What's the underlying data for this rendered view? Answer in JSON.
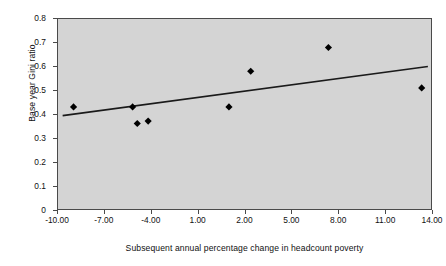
{
  "chart_data": {
    "type": "scatter",
    "title": "",
    "xlabel": "Subsequent annual percentage change in headcount poverty",
    "ylabel": "Base year Gini ratio",
    "xlim": [
      -10.0,
      14.0
    ],
    "ylim": [
      0,
      0.8
    ],
    "grid": false,
    "legend": null,
    "x_tick_labels": [
      "-10.00",
      "-7.00",
      "-4.00",
      "1.00",
      "2.00",
      "5.00",
      "8.00",
      "11.00",
      "14.00"
    ],
    "x_tick_values": [
      -10,
      -7,
      -4,
      -1,
      2,
      5,
      8,
      11,
      14
    ],
    "y_tick_labels": [
      "0",
      "0.1",
      "0.2",
      "0.3",
      "0.4",
      "0.5",
      "0.6",
      "0.7",
      "0.8"
    ],
    "y_tick_values": [
      0,
      0.1,
      0.2,
      0.3,
      0.4,
      0.5,
      0.6,
      0.7,
      0.8
    ],
    "series": [
      {
        "name": "observations",
        "marker": "diamond",
        "color": "#000000",
        "points": [
          {
            "x": -9.0,
            "y": 0.43
          },
          {
            "x": -5.2,
            "y": 0.43
          },
          {
            "x": -4.9,
            "y": 0.36
          },
          {
            "x": -4.2,
            "y": 0.37
          },
          {
            "x": 1.0,
            "y": 0.43
          },
          {
            "x": 2.4,
            "y": 0.58
          },
          {
            "x": 7.4,
            "y": 0.68
          },
          {
            "x": 13.4,
            "y": 0.51
          }
        ]
      }
    ],
    "trendline": {
      "name": "linear fit",
      "color": "#1a1a1a",
      "x_start": -9.7,
      "y_start": 0.393,
      "x_end": 13.8,
      "y_end": 0.6
    },
    "plot_background": "#d4d4d4",
    "frame_color": "#4a4a4a",
    "figure_background": "#ffffff"
  }
}
